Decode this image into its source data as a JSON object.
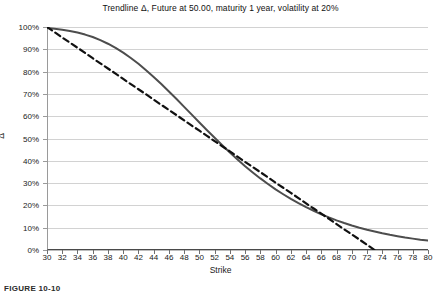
{
  "chart_data": {
    "type": "line",
    "title": "Trendline Δ, Future at 50.00, maturity 1 year, volatility at 20%",
    "xlabel": "Strike",
    "ylabel": "Δ",
    "xlim": [
      30,
      80
    ],
    "ylim": [
      0,
      1
    ],
    "grid": "horizontal",
    "legend": "none",
    "x_tick_labels": [
      "30",
      "32",
      "34",
      "36",
      "38",
      "40",
      "42",
      "44",
      "46",
      "48",
      "50",
      "52",
      "54",
      "56",
      "58",
      "60",
      "62",
      "64",
      "66",
      "68",
      "70",
      "72",
      "74",
      "76",
      "78",
      "80"
    ],
    "x_tick_values": [
      30,
      32,
      34,
      36,
      38,
      40,
      42,
      44,
      46,
      48,
      50,
      52,
      54,
      56,
      58,
      60,
      62,
      64,
      66,
      68,
      70,
      72,
      74,
      76,
      78,
      80
    ],
    "y_tick_labels": [
      "0%",
      "10%",
      "20%",
      "30%",
      "40%",
      "50%",
      "60%",
      "70%",
      "80%",
      "90%",
      "100%"
    ],
    "y_tick_values": [
      0,
      0.1,
      0.2,
      0.3,
      0.4,
      0.5,
      0.6,
      0.7,
      0.8,
      0.9,
      1.0
    ],
    "x": [
      30,
      31,
      32,
      33,
      34,
      35,
      36,
      37,
      38,
      39,
      40,
      41,
      42,
      43,
      44,
      45,
      46,
      47,
      48,
      49,
      50,
      51,
      52,
      53,
      54,
      55,
      56,
      57,
      58,
      59,
      60,
      61,
      62,
      63,
      64,
      65,
      66,
      67,
      68,
      69,
      70,
      71,
      72,
      73,
      74,
      75,
      76,
      77,
      78,
      79,
      80
    ],
    "series": [
      {
        "name": "Delta",
        "style": "solid",
        "color": "#4d4d4d",
        "width": 2.0,
        "values": [
          0.995,
          0.992,
          0.988,
          0.982,
          0.975,
          0.966,
          0.955,
          0.941,
          0.925,
          0.906,
          0.885,
          0.861,
          0.835,
          0.806,
          0.776,
          0.744,
          0.711,
          0.677,
          0.642,
          0.607,
          0.572,
          0.537,
          0.503,
          0.47,
          0.437,
          0.406,
          0.376,
          0.348,
          0.321,
          0.296,
          0.272,
          0.25,
          0.229,
          0.21,
          0.192,
          0.176,
          0.16,
          0.146,
          0.133,
          0.121,
          0.11,
          0.1,
          0.091,
          0.083,
          0.075,
          0.068,
          0.062,
          0.056,
          0.051,
          0.046,
          0.042
        ]
      },
      {
        "name": "Trendline",
        "style": "dashed",
        "color": "#111111",
        "width": 2.2,
        "values": [
          1.0,
          0.977,
          0.953,
          0.93,
          0.907,
          0.884,
          0.86,
          0.837,
          0.814,
          0.791,
          0.767,
          0.744,
          0.721,
          0.698,
          0.674,
          0.651,
          0.628,
          0.605,
          0.581,
          0.558,
          0.535,
          0.512,
          0.488,
          0.465,
          0.442,
          0.419,
          0.395,
          0.372,
          0.349,
          0.326,
          0.302,
          0.279,
          0.256,
          0.233,
          0.209,
          0.186,
          0.163,
          0.14,
          0.116,
          0.093,
          0.07,
          0.047,
          0.023,
          0.0,
          null,
          null,
          null,
          null,
          null,
          null,
          null
        ]
      }
    ]
  },
  "caption": "FIGURE 10-10"
}
